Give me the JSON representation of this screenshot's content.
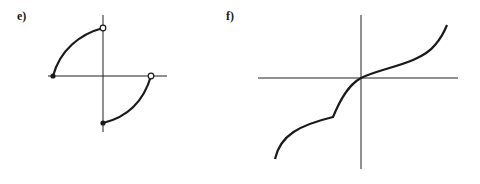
{
  "figure": {
    "background": "#ffffff",
    "ink_color": "#1a1a1a",
    "panels": [
      {
        "id": "e",
        "label": "e)",
        "description": "Piecewise graph: two quarter-circle arcs, one in quadrant II (from filled dot on negative x-axis up to open circle on positive y-axis) and one in quadrant IV (from filled dot on negative y-axis up to open circle on positive x-axis)",
        "endpoints": [
          {
            "position": "negative-x-axis",
            "style": "filled"
          },
          {
            "position": "positive-y-axis",
            "style": "open"
          },
          {
            "position": "negative-y-axis",
            "style": "filled"
          },
          {
            "position": "positive-x-axis",
            "style": "open"
          }
        ]
      },
      {
        "id": "f",
        "label": "f)",
        "description": "Increasing continuous curve passing through the origin with a cusp (corner) in quadrant III; concave up near the right end, steep rise at the lower-left start"
      }
    ]
  }
}
